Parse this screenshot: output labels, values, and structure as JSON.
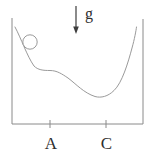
{
  "diagram": {
    "type": "physics-potential-curve",
    "labels": {
      "gravity": "g",
      "point_a": "A",
      "point_c": "C"
    },
    "colors": {
      "background": "#ffffff",
      "container_outline": "#8a8a8a",
      "curve": "#9a9a9a",
      "ball": "#9a9a9a",
      "arrow": "#3d3d3d",
      "text": "#2e2e2e"
    }
  }
}
